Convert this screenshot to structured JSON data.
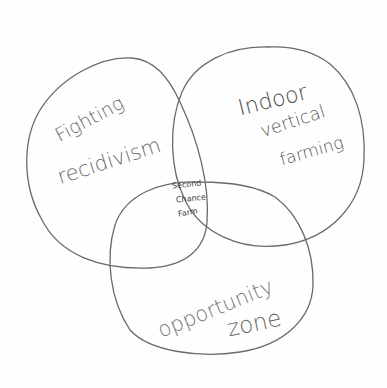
{
  "diagram": {
    "type": "venn",
    "style": "hand-drawn pencil sketch",
    "background_color": "#fefefe",
    "stroke_color": "#6a6a6a",
    "sets": [
      {
        "id": "left",
        "label_lines": [
          "Fighting",
          "recidivism"
        ]
      },
      {
        "id": "right",
        "label_lines": [
          "Indoor",
          "vertical",
          "farming"
        ]
      },
      {
        "id": "bottom",
        "label_lines": [
          "opportunity",
          "zone"
        ]
      }
    ],
    "intersection": {
      "sets": [
        "left",
        "right",
        "bottom"
      ],
      "label_lines": [
        "Second",
        "Chance",
        "Farm"
      ]
    }
  }
}
